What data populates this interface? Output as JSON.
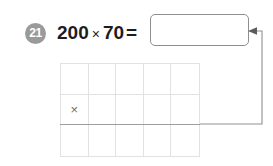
{
  "problem": {
    "number": "21",
    "equation": {
      "left_operand": "200",
      "operator": "×",
      "right_operand": "70",
      "equals": "="
    },
    "answer": {
      "value": "",
      "placeholder": ""
    }
  },
  "workspace": {
    "columns": 5,
    "rows": 3,
    "operator_symbol": "×",
    "operator_cell": {
      "row": 2,
      "column": 1
    },
    "cells": [
      [
        "",
        "",
        "",
        "",
        ""
      ],
      [
        "×",
        "",
        "",
        "",
        ""
      ],
      [
        "",
        "",
        "",
        "",
        ""
      ]
    ]
  },
  "colors": {
    "badge_fill": "#9a9a9a",
    "badge_text": "#ffffff",
    "equation_text": "#1d1d1d",
    "box_border": "#8f8f8f",
    "grid_line": "#e2e2e2",
    "product_rule": "#9d9d9d",
    "connector": "#8f8f8f",
    "background": "#ffffff"
  }
}
